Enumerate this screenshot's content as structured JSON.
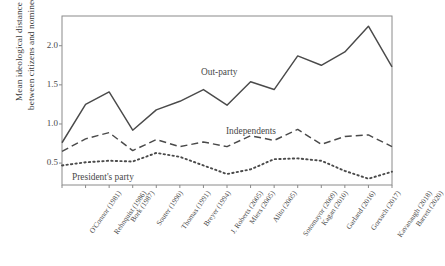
{
  "chart_data": {
    "type": "line",
    "title": "",
    "xlabel": "",
    "ylabel_line1": "Mean ideological distance",
    "ylabel_line2": "between citizens and nominees",
    "categories": [
      "O'Connor (1981)",
      "Rehnquist (1986)",
      "Bork (1987)",
      "Souter (1990)",
      "Thomas (1991)",
      "Breyer (1994)",
      "J. Roberts (2005)",
      "Miers (2005)",
      "Alito (2005)",
      "Sotomayor (2009)",
      "Kagan (2010)",
      "Garland (2016)",
      "Gorsuch (2017)",
      "Kavanaugh (2018)",
      "Barrett (2020)"
    ],
    "ytick_labels": [
      "0.5",
      "1.0",
      "1.5",
      "2.0"
    ],
    "ytick_values": [
      0.5,
      1.0,
      1.5,
      2.0
    ],
    "ylim": [
      0.22,
      2.38
    ],
    "grid": false,
    "legend_position": "inline-annotations",
    "series": [
      {
        "name": "Out-party",
        "style": "solid",
        "color": "#4a4a4a",
        "values": [
          0.76,
          1.25,
          1.41,
          0.92,
          1.18,
          1.29,
          1.44,
          1.24,
          1.54,
          1.44,
          1.87,
          1.75,
          1.92,
          2.25,
          1.73
        ]
      },
      {
        "name": "Independents",
        "style": "dashed",
        "color": "#4a4a4a",
        "values": [
          0.65,
          0.81,
          0.89,
          0.66,
          0.8,
          0.71,
          0.77,
          0.71,
          0.85,
          0.79,
          0.93,
          0.74,
          0.84,
          0.86,
          0.71
        ]
      },
      {
        "name": "President's party",
        "style": "dotted",
        "color": "#4a4a4a",
        "values": [
          0.47,
          0.51,
          0.53,
          0.52,
          0.63,
          0.58,
          0.47,
          0.36,
          0.42,
          0.55,
          0.56,
          0.53,
          0.4,
          0.3,
          0.39
        ]
      }
    ],
    "annotations": [
      {
        "text": "Out-party",
        "x_px": 201,
        "y_px": 67
      },
      {
        "text": "Independents",
        "x_px": 226,
        "y_px": 126
      },
      {
        "text": "President's party",
        "x_px": 72,
        "y_px": 172
      }
    ],
    "axes": {
      "frame_color": "#8a8a8a",
      "plot_left": 62,
      "plot_right": 392,
      "plot_top": 16,
      "plot_bottom": 185
    }
  }
}
